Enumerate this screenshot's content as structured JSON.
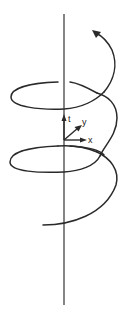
{
  "diagram": {
    "type": "helix-trajectory",
    "axes": {
      "t_label": "t",
      "x_label": "x",
      "y_label": "y"
    },
    "colors": {
      "stroke": "#2a2a2a",
      "background": "#ffffff"
    }
  }
}
